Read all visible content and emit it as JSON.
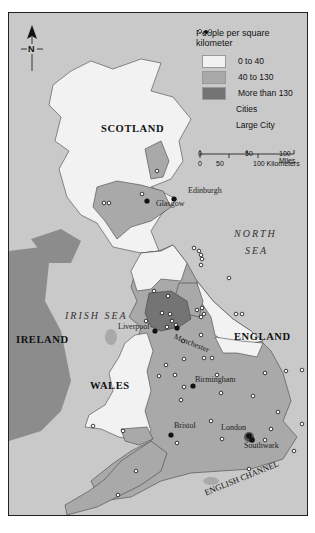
{
  "legend": {
    "title": "People per square kilometer",
    "items": [
      {
        "label": "0 to 40",
        "color": "#f2f2f2"
      },
      {
        "label": "40 to 130",
        "color": "#a9a9a9"
      },
      {
        "label": "More than 130",
        "color": "#747474"
      },
      {
        "label": "Cities",
        "symbol": "small-open-circles"
      },
      {
        "label": "Large City",
        "symbol": "filled-dot"
      }
    ]
  },
  "scale_bar": {
    "miles_labels": [
      "0",
      "50",
      "100 Miles"
    ],
    "km_labels": [
      "0",
      "50",
      "100 Kilometers"
    ]
  },
  "compass": {
    "label": "N"
  },
  "regions": {
    "scotland": "SCOTLAND",
    "england": "ENGLAND",
    "wales": "WALES",
    "ireland": "IRELAND"
  },
  "seas": {
    "north_sea_line1": "NORTH",
    "north_sea_line2": "SEA",
    "irish_sea": "IRISH  SEA",
    "english_channel": "ENGLISH CHANNEL"
  },
  "cities": {
    "edinburgh": "Edinburgh",
    "glasgow": "Glasgow",
    "liverpool": "Liverpool",
    "manchester": "Manchester",
    "birmingham": "Birmingham",
    "bristol": "Bristol",
    "london": "London",
    "southwark": "Southwark"
  },
  "colors": {
    "sea": "#c9c9c9",
    "ireland": "#8c8c8c",
    "low": "#f2f2f2",
    "medium": "#a9a9a9",
    "high": "#747474",
    "border": "#222222"
  }
}
